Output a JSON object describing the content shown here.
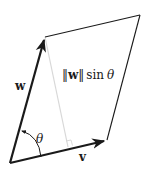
{
  "diagram": {
    "type": "parallelogram-cross-product-area",
    "vertices": {
      "origin": [
        10,
        163
      ],
      "v_tip": [
        107,
        140
      ],
      "w_tip": [
        45,
        37
      ],
      "far_corner": [
        140,
        15
      ]
    },
    "height_foot": [
      68,
      147
    ],
    "colors": {
      "stroke": "#1a1a1a",
      "height_line": "#d8d8d8",
      "background": "#ffffff"
    }
  },
  "labels": {
    "w": "w",
    "v": "v",
    "theta": "θ",
    "height_norm_open": "‖",
    "height_w": "w",
    "height_norm_close": "‖",
    "height_sin": "sin",
    "height_theta": "θ"
  }
}
